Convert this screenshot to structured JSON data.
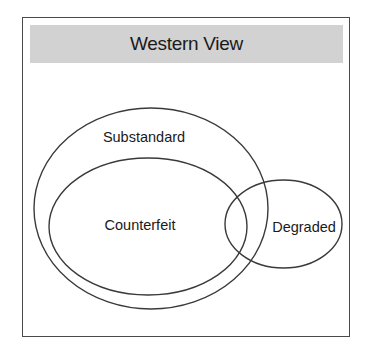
{
  "diagram": {
    "title": "Western View",
    "type": "venn",
    "sets": [
      {
        "id": "substandard",
        "label": "Substandard",
        "contains": [
          "counterfeit"
        ]
      },
      {
        "id": "counterfeit",
        "label": "Counterfeit",
        "subset_of": "substandard"
      },
      {
        "id": "degraded",
        "label": "Degraded",
        "overlaps": [
          "substandard",
          "counterfeit"
        ]
      }
    ],
    "colors": {
      "header_band": "#d2d2d2",
      "stroke": "#3a3a3a",
      "frame": "#4a4a4a",
      "text": "#1a1a1a",
      "background": "#ffffff"
    }
  }
}
